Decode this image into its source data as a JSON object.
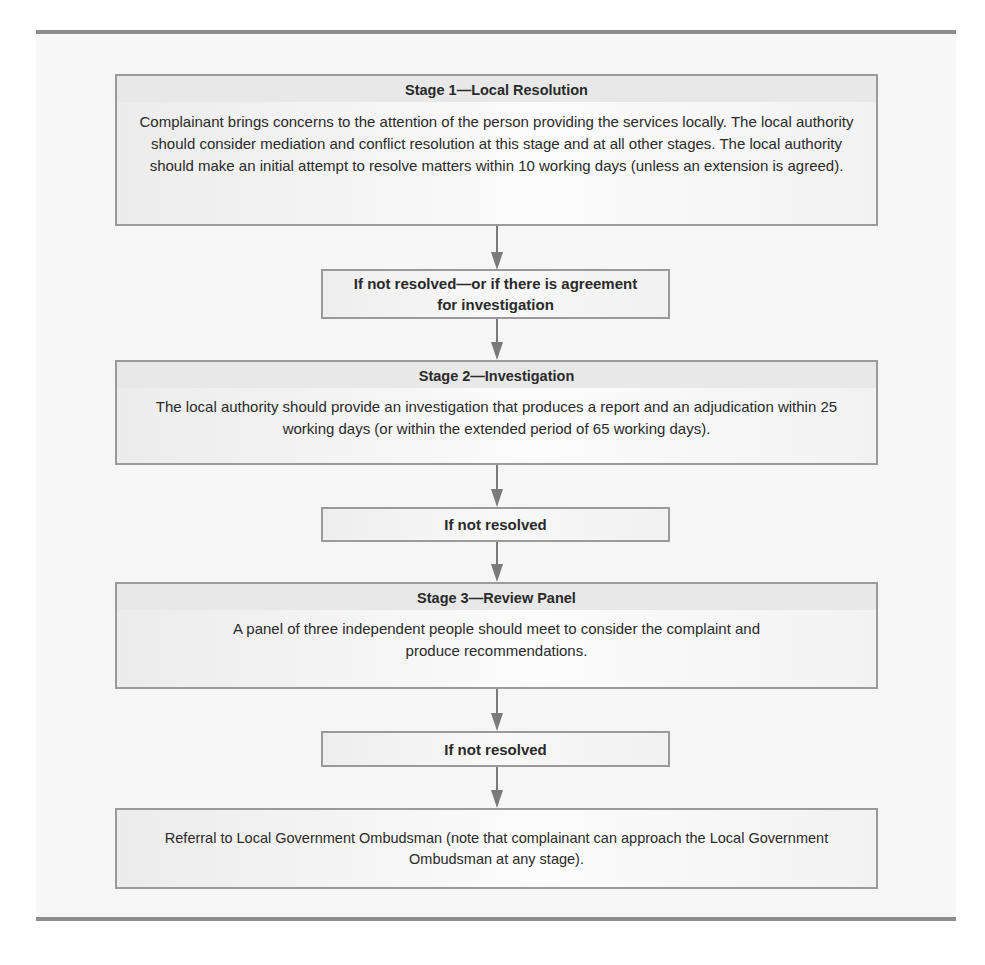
{
  "flowchart": {
    "stage1": {
      "title": "Stage 1—Local Resolution",
      "body": "Complainant brings concerns to the attention of the person providing the services locally. The local authority should consider mediation and conflict resolution at this stage and at all other stages. The local authority should make an initial attempt to resolve matters within 10 working days (unless an extension is agreed)."
    },
    "condition1": "If not resolved—or if there is agreement for investigation",
    "stage2": {
      "title": "Stage 2—Investigation",
      "body": "The local authority should provide an investigation that produces a report and an adjudication within 25 working days (or within the extended period of 65 working days)."
    },
    "condition2": "If not resolved",
    "stage3": {
      "title": "Stage 3—Review Panel",
      "body": "A panel of three independent people should meet to consider the complaint and produce recommendations."
    },
    "condition3": "If not resolved",
    "final": "Referral to Local Government Ombudsman (note that complainant can approach the Local Government Ombudsman at any stage)."
  },
  "colors": {
    "border": "#9a9a9a",
    "arrow": "#7a7a7a",
    "rule": "#8c8c8c",
    "title_band": "#e8e8e8"
  }
}
